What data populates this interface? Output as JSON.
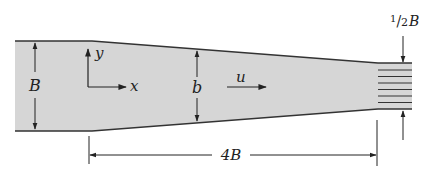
{
  "diagram": {
    "colors": {
      "fluid_fill": "#d6d6d6",
      "wall_stroke": "#333333",
      "line": "#222222"
    },
    "labels": {
      "inlet_width": "B",
      "local_width": "b",
      "axis_x": "x",
      "axis_y": "y",
      "velocity": "u",
      "length": "4B",
      "outlet_width_num": "1",
      "outlet_width_den": "2",
      "outlet_width_var": "B"
    }
  }
}
